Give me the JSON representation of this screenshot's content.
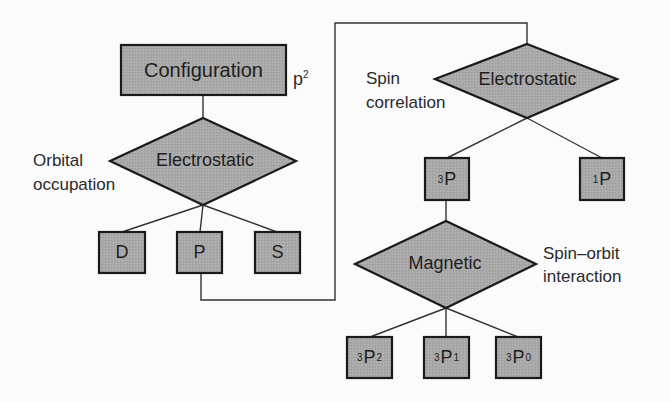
{
  "diagram": {
    "colors": {
      "node_fill": "#a9a9a9",
      "node_stroke": "#1a1a1a",
      "line": "#333333",
      "background": "#fbfbfb"
    },
    "configuration": {
      "label": "Configuration",
      "annotation_base": "p",
      "annotation_sup": "2"
    },
    "orbital_step": {
      "label": "Electrostatic",
      "side_label_line1": "Orbital",
      "side_label_line2": "occupation"
    },
    "orbital_terms": [
      {
        "label": "D"
      },
      {
        "label": "P"
      },
      {
        "label": "S"
      }
    ],
    "spin_step": {
      "label": "Electrostatic",
      "side_label_line1": "Spin",
      "side_label_line2": "correlation"
    },
    "spin_terms": [
      {
        "sup": "3",
        "base": "P"
      },
      {
        "sup": "1",
        "base": "P"
      }
    ],
    "magnetic_step": {
      "label": "Magnetic",
      "side_label_line1": "Spin–orbit",
      "side_label_line2": "interaction"
    },
    "levels": [
      {
        "sup": "3",
        "base": "P",
        "sub": "2"
      },
      {
        "sup": "3",
        "base": "P",
        "sub": "1"
      },
      {
        "sup": "3",
        "base": "P",
        "sub": "0"
      }
    ]
  }
}
